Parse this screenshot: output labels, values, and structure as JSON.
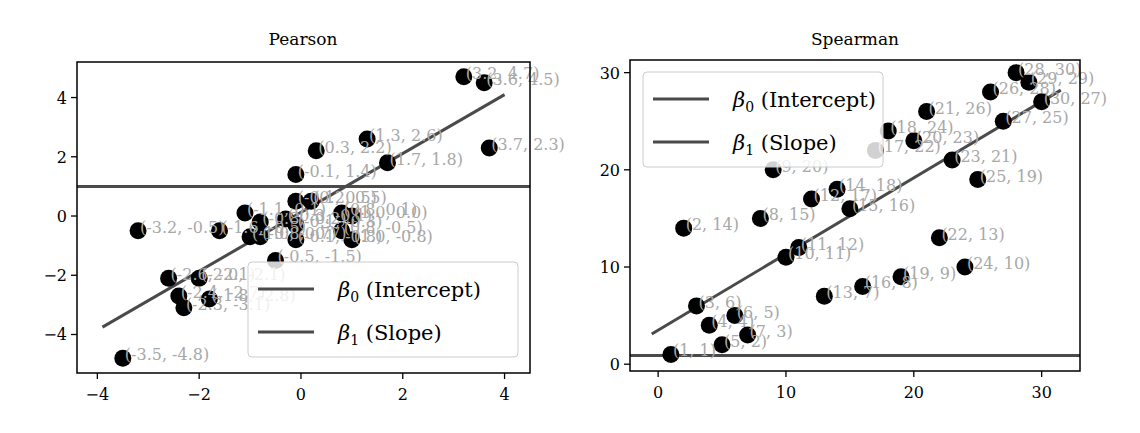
{
  "figure": {
    "width": 1140,
    "height": 433
  },
  "chart_data": [
    {
      "type": "scatter",
      "title": "Pearson",
      "xlabel": "",
      "ylabel": "",
      "xlim": [
        -4.4,
        4.5
      ],
      "ylim": [
        -5.3,
        5.2
      ],
      "xticks": [
        -4,
        -2,
        0,
        2,
        4
      ],
      "yticks": [
        -4,
        -2,
        0,
        2,
        4
      ],
      "xtick_labels": [
        "−4",
        "−2",
        "0",
        "2",
        "4"
      ],
      "ytick_labels": [
        "−4",
        "−2",
        "0",
        "2",
        "4"
      ],
      "grid": false,
      "legend_position": "lower right",
      "legend": [
        {
          "label_main": "β",
          "label_sub": "0",
          "label_rest": " (Intercept)",
          "color": "#4a4a4a"
        },
        {
          "label_main": "β",
          "label_sub": "1",
          "label_rest": " (Slope)",
          "color": "#4a4a4a"
        }
      ],
      "lines": [
        {
          "name": "intercept",
          "x": [
            -4.4,
            4.5
          ],
          "y": [
            1.0,
            1.0
          ]
        },
        {
          "name": "slope",
          "x": [
            -3.9,
            4.0
          ],
          "y": [
            -3.75,
            4.1
          ]
        }
      ],
      "points": [
        {
          "x": 3.2,
          "y": 4.7,
          "label": "(3.2, 4.7)"
        },
        {
          "x": 3.6,
          "y": 4.5,
          "label": "(3.6, 4.5)"
        },
        {
          "x": 3.7,
          "y": 2.3,
          "label": "(3.7, 2.3)"
        },
        {
          "x": 1.3,
          "y": 2.6,
          "label": "(1.3, 2.6)"
        },
        {
          "x": 0.3,
          "y": 2.2,
          "label": "(0.3, 2.2)"
        },
        {
          "x": 1.7,
          "y": 1.8,
          "label": "(1.7, 1.8)"
        },
        {
          "x": -0.1,
          "y": 1.4,
          "label": "(-0.1, 1.4)"
        },
        {
          "x": -0.1,
          "y": 0.5,
          "label": "(-0.1, 0.5)"
        },
        {
          "x": 0.2,
          "y": 0.5,
          "label": "(0.2, 0.5)"
        },
        {
          "x": 0.8,
          "y": 0.1,
          "label": "(0.8, 0.1)"
        },
        {
          "x": 1.0,
          "y": 0.0,
          "label": "(1.0, 0.0)"
        },
        {
          "x": -1.1,
          "y": 0.1,
          "label": "(-1.1, 0.1)"
        },
        {
          "x": -0.8,
          "y": -0.2,
          "label": "(-0.8, -0.2)"
        },
        {
          "x": -0.3,
          "y": -0.1,
          "label": "(-0.3, -0.1)"
        },
        {
          "x": -0.1,
          "y": -0.3,
          "label": "(-0.1, -0.3)"
        },
        {
          "x": 0.8,
          "y": -0.5,
          "label": "(0.8, -0.5)"
        },
        {
          "x": 1.0,
          "y": -0.8,
          "label": "(1.0, -0.8)"
        },
        {
          "x": -3.2,
          "y": -0.5,
          "label": "(-3.2, -0.5)"
        },
        {
          "x": -1.6,
          "y": -0.5,
          "label": "(-1.6, -0.5)"
        },
        {
          "x": -1.0,
          "y": -0.7,
          "label": "(-1.0, -0.7)"
        },
        {
          "x": -0.8,
          "y": -0.7,
          "label": "(-0.8, -0.7)"
        },
        {
          "x": -0.1,
          "y": -0.8,
          "label": "(-0.1, -0.8)"
        },
        {
          "x": -0.5,
          "y": -1.5,
          "label": "(-0.5, -1.5)"
        },
        {
          "x": -2.6,
          "y": -2.1,
          "label": "(-2.6, -2.1)"
        },
        {
          "x": -2.0,
          "y": -2.1,
          "label": "(-2.0, -2.1)"
        },
        {
          "x": -2.4,
          "y": -2.7,
          "label": "(-2.4, -2.7)"
        },
        {
          "x": -1.8,
          "y": -2.8,
          "label": "(-1.8, -2.8)"
        },
        {
          "x": -2.3,
          "y": -3.1,
          "label": "(-2.3, -3.1)"
        },
        {
          "x": -3.5,
          "y": -4.8,
          "label": "(-3.5, -4.8)"
        }
      ]
    },
    {
      "type": "scatter",
      "title": "Spearman",
      "xlabel": "",
      "ylabel": "",
      "xlim": [
        -2.2,
        33.0
      ],
      "ylim": [
        -0.7,
        31.3
      ],
      "xticks": [
        0,
        10,
        20,
        30
      ],
      "yticks": [
        0,
        10,
        20,
        30
      ],
      "xtick_labels": [
        "0",
        "10",
        "20",
        "30"
      ],
      "ytick_labels": [
        "0",
        "10",
        "20",
        "30"
      ],
      "grid": false,
      "legend_position": "upper left",
      "legend": [
        {
          "label_main": "β",
          "label_sub": "0",
          "label_rest": " (Intercept)",
          "color": "#4a4a4a"
        },
        {
          "label_main": "β",
          "label_sub": "1",
          "label_rest": " (Slope)",
          "color": "#4a4a4a"
        }
      ],
      "lines": [
        {
          "name": "intercept",
          "x": [
            -2.2,
            33.0
          ],
          "y": [
            0.9,
            0.9
          ]
        },
        {
          "name": "slope",
          "x": [
            -0.5,
            31.5
          ],
          "y": [
            3.1,
            28.2
          ]
        }
      ],
      "points": [
        {
          "x": 28,
          "y": 30,
          "label": "(28, 30)"
        },
        {
          "x": 29,
          "y": 29,
          "label": "(29, 29)"
        },
        {
          "x": 26,
          "y": 28,
          "label": "(26, 28)"
        },
        {
          "x": 30,
          "y": 27,
          "label": "(30, 27)"
        },
        {
          "x": 21,
          "y": 26,
          "label": "(21, 26)"
        },
        {
          "x": 27,
          "y": 25,
          "label": "(27, 25)"
        },
        {
          "x": 18,
          "y": 24,
          "label": "(18, 24)"
        },
        {
          "x": 20,
          "y": 23,
          "label": "(20, 23)"
        },
        {
          "x": 17,
          "y": 22,
          "label": "(17, 22)"
        },
        {
          "x": 23,
          "y": 21,
          "label": "(23, 21)"
        },
        {
          "x": 9,
          "y": 20,
          "label": "(9, 20)"
        },
        {
          "x": 25,
          "y": 19,
          "label": "(25, 19)"
        },
        {
          "x": 14,
          "y": 18,
          "label": "(14, 18)"
        },
        {
          "x": 12,
          "y": 17,
          "label": "(12, 17)"
        },
        {
          "x": 15,
          "y": 16,
          "label": "(15, 16)"
        },
        {
          "x": 8,
          "y": 15,
          "label": "(8, 15)"
        },
        {
          "x": 2,
          "y": 14,
          "label": "(2, 14)"
        },
        {
          "x": 22,
          "y": 13,
          "label": "(22, 13)"
        },
        {
          "x": 11,
          "y": 12,
          "label": "(11, 12)"
        },
        {
          "x": 10,
          "y": 11,
          "label": "(10, 11)"
        },
        {
          "x": 24,
          "y": 10,
          "label": "(24, 10)"
        },
        {
          "x": 19,
          "y": 9,
          "label": "(19, 9)"
        },
        {
          "x": 16,
          "y": 8,
          "label": "(16, 8)"
        },
        {
          "x": 13,
          "y": 7,
          "label": "(13, 7)"
        },
        {
          "x": 3,
          "y": 6,
          "label": "(3, 6)"
        },
        {
          "x": 6,
          "y": 5,
          "label": "(6, 5)"
        },
        {
          "x": 4,
          "y": 4,
          "label": "(4, 4)"
        },
        {
          "x": 7,
          "y": 3,
          "label": "(7, 3)"
        },
        {
          "x": 5,
          "y": 2,
          "label": "(5, 2)"
        },
        {
          "x": 1,
          "y": 1,
          "label": "(1, 1)"
        }
      ]
    }
  ],
  "style": {
    "point_color": "#000000",
    "label_color": "#a8a8a8",
    "line_color": "#4a4a4a",
    "axis_color": "#000000",
    "legend_border": "#cccccc"
  }
}
